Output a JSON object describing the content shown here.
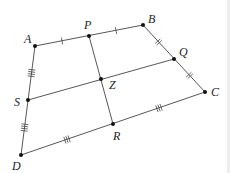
{
  "diagram": {
    "type": "quadrilateral-midpoints",
    "points": {
      "A": {
        "label": "A",
        "x": 35,
        "y": 46
      },
      "P": {
        "label": "P",
        "x": 89,
        "y": 36
      },
      "B": {
        "label": "B",
        "x": 143,
        "y": 25
      },
      "Q": {
        "label": "Q",
        "x": 174,
        "y": 59
      },
      "C": {
        "label": "C",
        "x": 205,
        "y": 92
      },
      "R": {
        "label": "R",
        "x": 113,
        "y": 124
      },
      "D": {
        "label": "D",
        "x": 21,
        "y": 155
      },
      "S": {
        "label": "S",
        "x": 28,
        "y": 100
      },
      "Z": {
        "label": "Z",
        "x": 101,
        "y": 79
      }
    },
    "segments": [
      "AB",
      "BC",
      "CD",
      "DA",
      "PR",
      "SQ"
    ],
    "tick_marks": {
      "AP": 1,
      "PB": 1,
      "BQ": 2,
      "QC": 2,
      "CR": 3,
      "RD": 3,
      "DS": 4,
      "SA": 4
    },
    "line_color": "#333333",
    "point_color": "#111111"
  }
}
